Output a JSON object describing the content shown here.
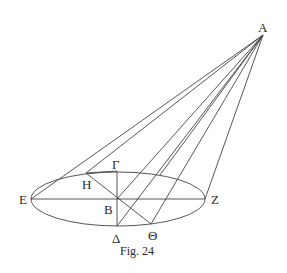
{
  "figure": {
    "caption": "Fig. 24",
    "stroke_color": "#444444",
    "points": {
      "A": {
        "label": "A",
        "x": 263,
        "y": 35
      },
      "B": {
        "label": "B",
        "x": 117,
        "y": 199
      },
      "Gamma": {
        "label": "Γ",
        "x": 117,
        "y": 171
      },
      "Delta": {
        "label": "Δ",
        "x": 117,
        "y": 226
      },
      "E": {
        "label": "E",
        "x": 31,
        "y": 199
      },
      "Z": {
        "label": "Z",
        "x": 205,
        "y": 199
      },
      "H": {
        "label": "H",
        "x": 86,
        "y": 173
      },
      "Theta": {
        "label": "Θ",
        "x": 151,
        "y": 224
      }
    },
    "ellipse": {
      "cx": 118,
      "cy": 199,
      "rx": 87,
      "ry": 27
    }
  }
}
